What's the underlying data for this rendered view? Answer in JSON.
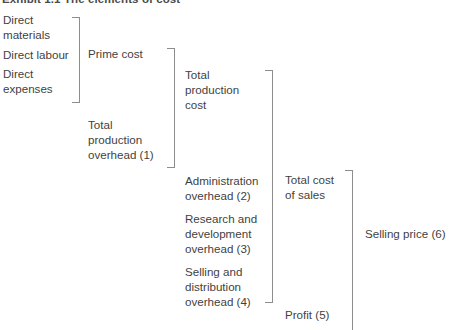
{
  "title": "Exhibit 1.1  The elements of cost",
  "colors": {
    "text": "#3f3f3f",
    "bracket": "#8d8d8d",
    "background": "#ffffff"
  },
  "diagram": {
    "type": "bracket-hierarchy",
    "columns": [
      {
        "name": "direct-costs",
        "items": [
          {
            "key": "direct_materials",
            "label": "Direct\nmaterials"
          },
          {
            "key": "direct_labour",
            "label": "Direct labour"
          },
          {
            "key": "direct_expenses",
            "label": "Direct\nexpenses"
          }
        ]
      },
      {
        "name": "prime-and-overhead",
        "items": [
          {
            "key": "prime_cost",
            "label": "Prime cost"
          },
          {
            "key": "total_production_overhead",
            "label": "Total\nproduction\noverhead (1)"
          }
        ]
      },
      {
        "name": "production-cost-and-other-overheads",
        "items": [
          {
            "key": "total_production_cost",
            "label": "Total\nproduction\ncost"
          },
          {
            "key": "administration_overhead",
            "label": "Administration\noverhead (2)"
          },
          {
            "key": "research_development_overhead",
            "label": "Research and\ndevelopment\noverhead (3)"
          },
          {
            "key": "selling_distribution_overhead",
            "label": "Selling and\ndistribution\noverhead (4)"
          }
        ]
      },
      {
        "name": "cost-of-sales-and-profit",
        "items": [
          {
            "key": "total_cost_of_sales",
            "label": "Total cost\nof sales"
          },
          {
            "key": "profit",
            "label": "Profit (5)"
          }
        ]
      },
      {
        "name": "selling-price",
        "items": [
          {
            "key": "selling_price",
            "label": "Selling price (6)"
          }
        ]
      }
    ],
    "brackets": [
      {
        "name": "direct-costs-bracket",
        "groups": [
          "direct_materials",
          "direct_labour",
          "direct_expenses"
        ],
        "leads_to": "prime_cost"
      },
      {
        "name": "prime-cost-overhead-bracket",
        "groups": [
          "prime_cost",
          "total_production_overhead"
        ],
        "leads_to": "total_production_cost"
      },
      {
        "name": "production-cost-overheads-bracket",
        "groups": [
          "total_production_cost",
          "administration_overhead",
          "research_development_overhead",
          "selling_distribution_overhead"
        ],
        "leads_to": "total_cost_of_sales"
      },
      {
        "name": "cost-of-sales-profit-bracket",
        "groups": [
          "total_cost_of_sales",
          "profit"
        ],
        "leads_to": "selling_price"
      }
    ]
  }
}
